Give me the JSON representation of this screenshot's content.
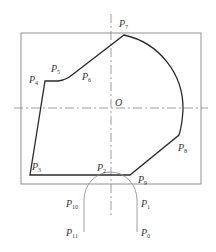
{
  "figure": {
    "type": "geometric-profile-diagram",
    "origin_label": "O",
    "colors": {
      "profile": "#2a2a2a",
      "frame": "#777777",
      "axis": "#777777",
      "tool": "#888888",
      "text": "#333333"
    },
    "points": [
      {
        "name": "P",
        "sub": "0",
        "x": 141,
        "y": 236
      },
      {
        "name": "P",
        "sub": "1",
        "x": 141,
        "y": 207
      },
      {
        "name": "P",
        "sub": "2",
        "x": 97,
        "y": 171
      },
      {
        "name": "P",
        "sub": "3",
        "x": 32,
        "y": 170
      },
      {
        "name": "P",
        "sub": "4",
        "x": 29,
        "y": 83
      },
      {
        "name": "P",
        "sub": "5",
        "x": 51,
        "y": 72
      },
      {
        "name": "P",
        "sub": "6",
        "x": 82,
        "y": 80
      },
      {
        "name": "P",
        "sub": "7",
        "x": 119,
        "y": 27
      },
      {
        "name": "P",
        "sub": "8",
        "x": 178,
        "y": 151
      },
      {
        "name": "P",
        "sub": "9",
        "x": 138,
        "y": 183
      },
      {
        "name": "P",
        "sub": "10",
        "x": 66,
        "y": 207
      },
      {
        "name": "P",
        "sub": "11",
        "x": 66,
        "y": 236
      }
    ]
  }
}
